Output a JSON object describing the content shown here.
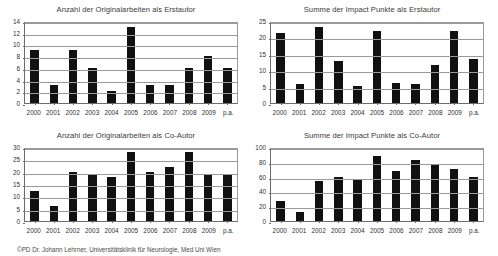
{
  "footer": {
    "credit": "©PD Dr. Johann Lehrner, Universitätsklinik für Neurologie, Med Uni Wien"
  },
  "chart_data": [
    {
      "id": "originalarbeiten-erstautor",
      "type": "bar",
      "title": "Anzahl der Originalarbeiten als Erstautor",
      "xlabel": "",
      "ylabel": "",
      "categories": [
        "2000",
        "2001",
        "2002",
        "2003",
        "2004",
        "2005",
        "2006",
        "2007",
        "2008",
        "2009",
        "p.a."
      ],
      "values": [
        9,
        3,
        9,
        6,
        2,
        13,
        3,
        3,
        6,
        8,
        6
      ],
      "yticks": [
        0,
        2,
        4,
        6,
        8,
        10,
        12,
        14
      ],
      "ylim": [
        0,
        14
      ],
      "grid": true,
      "legend": "none",
      "series": [
        {
          "name": "Anzahl",
          "values": [
            9,
            3,
            9,
            6,
            2,
            13,
            3,
            3,
            6,
            8,
            6
          ]
        }
      ]
    },
    {
      "id": "impact-punkte-erstautor",
      "type": "bar",
      "title": "Summe der Impact Punkte als Erstautor",
      "xlabel": "",
      "ylabel": "",
      "categories": [
        "2000",
        "2001",
        "2002",
        "2003",
        "2004",
        "2005",
        "2006",
        "2007",
        "2008",
        "2009",
        "p.a."
      ],
      "values": [
        21.4,
        5.8,
        23.2,
        12.7,
        5.1,
        22.1,
        6.2,
        5.7,
        11.7,
        21.9,
        13.5
      ],
      "yticks": [
        0,
        5,
        10,
        15,
        20,
        25
      ],
      "ylim": [
        0,
        25
      ],
      "grid": true,
      "legend": "none",
      "series": [
        {
          "name": "Impact Punkte",
          "values": [
            21.4,
            5.8,
            23.2,
            12.7,
            5.1,
            22.1,
            6.2,
            5.7,
            11.7,
            21.9,
            13.5
          ]
        }
      ]
    },
    {
      "id": "originalarbeiten-co-autor",
      "type": "bar",
      "title": "Anzahl der Originalarbeiten als Co-Autor",
      "xlabel": "",
      "ylabel": "",
      "categories": [
        "2000",
        "2001",
        "2002",
        "2003",
        "2004",
        "2005",
        "2006",
        "2007",
        "2008",
        "2009",
        "p.a."
      ],
      "values": [
        12,
        6,
        20,
        19,
        18,
        28,
        20,
        22,
        28,
        19,
        19
      ],
      "yticks": [
        0,
        5,
        10,
        15,
        20,
        25,
        30
      ],
      "ylim": [
        0,
        30
      ],
      "grid": true,
      "legend": "none",
      "series": [
        {
          "name": "Anzahl",
          "values": [
            12,
            6,
            20,
            19,
            18,
            28,
            20,
            22,
            28,
            19,
            19
          ]
        }
      ]
    },
    {
      "id": "impact-punkte-co-autor",
      "type": "bar",
      "title": "Summe der Impact Punkte als Co-Autor",
      "xlabel": "",
      "ylabel": "",
      "categories": [
        "2000",
        "2001",
        "2002",
        "2003",
        "2004",
        "2005",
        "2006",
        "2007",
        "2008",
        "2009",
        "p.a."
      ],
      "values": [
        27,
        12,
        54,
        60,
        56,
        88,
        67,
        83,
        76,
        70,
        59
      ],
      "yticks": [
        0,
        20,
        40,
        60,
        80,
        100
      ],
      "ylim": [
        0,
        100
      ],
      "grid": true,
      "legend": "none",
      "series": [
        {
          "name": "Impact Punkte",
          "values": [
            27,
            12,
            54,
            60,
            56,
            88,
            67,
            83,
            76,
            70,
            59
          ]
        }
      ]
    }
  ]
}
